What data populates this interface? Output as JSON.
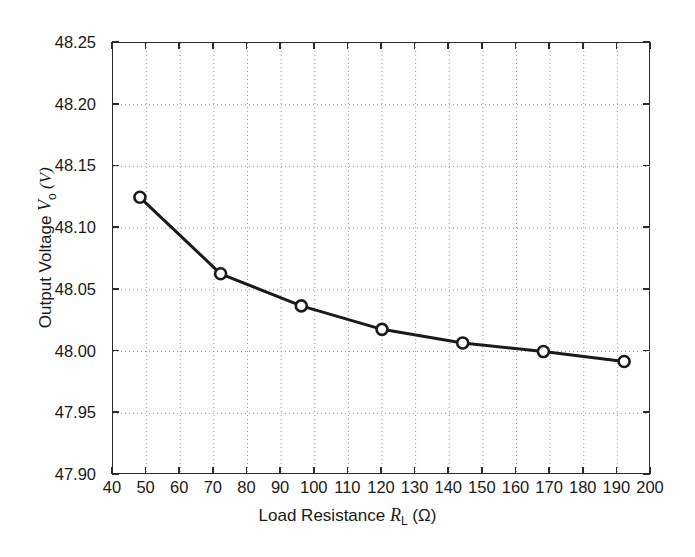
{
  "chart_data": {
    "type": "line",
    "title": "",
    "xlabel_parts": {
      "main": "Load Resistance ",
      "symbol": "R",
      "subscript": "L",
      "unit": " (Ω)"
    },
    "ylabel_parts": {
      "main": "Output Voltage ",
      "symbol": "V",
      "subscript": "o",
      "unit": " (V)"
    },
    "xlabel": "Load Resistance R_L (Ω)",
    "ylabel": "Output Voltage V_o (V)",
    "x": [
      48,
      72,
      96,
      120,
      144,
      168,
      192
    ],
    "y": [
      48.125,
      48.063,
      48.037,
      48.018,
      48.007,
      48.0,
      47.992
    ],
    "series": [
      {
        "name": "Output Voltage",
        "values": [
          48.125,
          48.063,
          48.037,
          48.018,
          48.007,
          48.0,
          47.992
        ]
      }
    ],
    "xlim": [
      40,
      200
    ],
    "ylim": [
      47.9,
      48.25
    ],
    "xticks": [
      40,
      50,
      60,
      70,
      80,
      90,
      100,
      110,
      120,
      130,
      140,
      150,
      160,
      170,
      180,
      190,
      200
    ],
    "yticks": [
      47.9,
      47.95,
      48.0,
      48.05,
      48.1,
      48.15,
      48.2,
      48.25
    ],
    "xtick_labels": [
      "40",
      "50",
      "60",
      "70",
      "80",
      "90",
      "100",
      "110",
      "120",
      "130",
      "140",
      "150",
      "160",
      "170",
      "180",
      "190",
      "200"
    ],
    "ytick_labels": [
      "47.90",
      "47.95",
      "48.00",
      "48.05",
      "48.10",
      "48.15",
      "48.20",
      "48.25"
    ],
    "grid": true,
    "grid_style": "dotted",
    "legend": null,
    "legend_position": "none",
    "line_color": "#1a1a1a",
    "line_width": 3.0,
    "marker": "circle-open",
    "marker_size": 11,
    "grid_color": "#9a9a9a",
    "axis_color": "#2b2b2b",
    "background": "#ffffff"
  }
}
